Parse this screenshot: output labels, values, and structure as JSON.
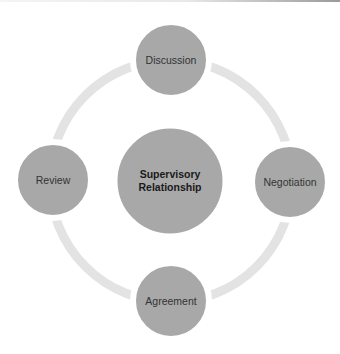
{
  "diagram": {
    "type": "cycle",
    "colors": {
      "ring": "#e3e3e3",
      "node_fill": "#a8a8a8",
      "node_stroke": "#ffffff",
      "label": "#333333",
      "center_label": "#1a1a1a"
    },
    "center": {
      "label_line1": "Supervisory",
      "label_line2": "Relationship"
    },
    "nodes": [
      {
        "label": "Discussion",
        "position": "top"
      },
      {
        "label": "Negotiation",
        "position": "right"
      },
      {
        "label": "Agreement",
        "position": "bottom"
      },
      {
        "label": "Review",
        "position": "left"
      }
    ]
  }
}
